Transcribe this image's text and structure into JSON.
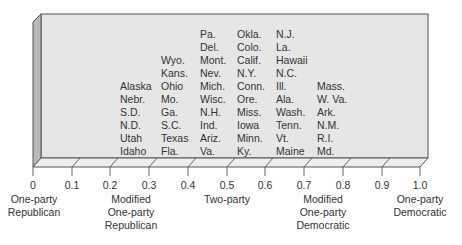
{
  "diagram": {
    "type": "3d-scale-box",
    "axis": {
      "ticks": [
        "0",
        "0.1",
        "0.2",
        "0.3",
        "0.4",
        "0.5",
        "0.6",
        "0.7",
        "0.8",
        "0.9",
        "1.0"
      ]
    },
    "categories": [
      {
        "line1": "One-party",
        "line2": "Republican",
        "line3": ""
      },
      {
        "line1": "Modified",
        "line2": "One-party",
        "line3": "Republican"
      },
      {
        "line1": "Two-party",
        "line2": "",
        "line3": ""
      },
      {
        "line1": "Modified",
        "line2": "One-party",
        "line3": "Democratic"
      },
      {
        "line1": "One-party",
        "line2": "Democratic",
        "line3": ""
      }
    ],
    "columns": [
      {
        "range": "0.2-0.3",
        "states": [
          "Alaska",
          "Nebr.",
          "S.D.",
          "N.D.",
          "Utah",
          "Idaho"
        ]
      },
      {
        "range": "0.3-0.4",
        "states": [
          "Wyo.",
          "Kans.",
          "Ohio",
          "Mo.",
          "Ga.",
          "S.C.",
          "Texas",
          "Fla."
        ]
      },
      {
        "range": "0.4-0.5",
        "states": [
          "Pa.",
          "Del.",
          "Mont.",
          "Nev.",
          "Mich.",
          "Wisc.",
          "N.H.",
          "Ind.",
          "Ariz.",
          "Va."
        ]
      },
      {
        "range": "0.5-0.6",
        "states": [
          "Okla.",
          "Colo.",
          "Calif.",
          "N.Y.",
          "Conn.",
          "Ore.",
          "Miss.",
          "Iowa",
          "Minn.",
          "Ky."
        ]
      },
      {
        "range": "0.6-0.7",
        "states": [
          "N.J.",
          "La.",
          "Hawaii",
          "N.C.",
          "Ill.",
          "Ala.",
          "Wash.",
          "Tenn.",
          "Vt.",
          "Maine"
        ]
      },
      {
        "range": "0.7-0.8",
        "states": [
          "Mass.",
          "W. Va.",
          "Ark.",
          "N.M.",
          "R.I.",
          "Md."
        ]
      }
    ],
    "colors": {
      "back_face": "#e6e6e6",
      "side_wall": "#b9b9b9",
      "floor": "#eeeeee",
      "edge": "#555555"
    }
  }
}
